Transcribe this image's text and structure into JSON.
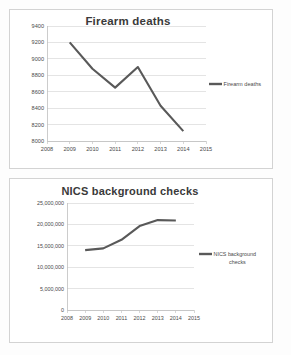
{
  "page": {
    "background_color": "#fdfdfd",
    "panel_border_color": "#d3d3d3"
  },
  "charts": [
    {
      "id": "firearm",
      "title": "Firearm deaths",
      "legend_label": "Firearm deaths",
      "legend_label_line1": "Firearm deaths",
      "legend_label_line2": "",
      "series_color": "#595959",
      "y_ticks": [
        "8000",
        "8200",
        "8400",
        "8600",
        "8800",
        "9000",
        "9200",
        "9400"
      ],
      "x_ticks": [
        "2008",
        "2009",
        "2010",
        "2011",
        "2012",
        "2013",
        "2014",
        "2015"
      ]
    },
    {
      "id": "nics",
      "title": "NICS background checks",
      "legend_label": "NICS background checks",
      "legend_label_line1": "NICS background",
      "legend_label_line2": "checks",
      "series_color": "#595959",
      "y_ticks": [
        "0",
        "5,000,000",
        "10,000,000",
        "15,000,000",
        "20,000,000",
        "25,000,000"
      ],
      "x_ticks": [
        "2008",
        "2009",
        "2010",
        "2011",
        "2012",
        "2013",
        "2014",
        "2015"
      ]
    }
  ],
  "chart_data": [
    {
      "type": "line",
      "id": "firearm",
      "title": "Firearm deaths",
      "xlabel": "",
      "ylabel": "",
      "x": [
        2009,
        2010,
        2011,
        2012,
        2013,
        2014
      ],
      "series": [
        {
          "name": "Firearm deaths",
          "values": [
            9200,
            8880,
            8650,
            8900,
            8430,
            8120
          ],
          "color": "#595959"
        }
      ],
      "xlim": [
        2008,
        2015
      ],
      "ylim": [
        8000,
        9400
      ],
      "y_tick_values": [
        8000,
        8200,
        8400,
        8600,
        8800,
        9000,
        9200,
        9400
      ],
      "x_tick_values": [
        2008,
        2009,
        2010,
        2011,
        2012,
        2013,
        2014,
        2015
      ],
      "grid": true,
      "legend": [
        "Firearm deaths"
      ],
      "legend_position": "right"
    },
    {
      "type": "line",
      "id": "nics",
      "title": "NICS background checks",
      "xlabel": "",
      "ylabel": "",
      "x": [
        2009,
        2010,
        2011,
        2012,
        2013,
        2014
      ],
      "series": [
        {
          "name": "NICS background checks",
          "values": [
            14000000,
            14400000,
            16400000,
            19600000,
            21000000,
            20900000
          ],
          "color": "#595959"
        }
      ],
      "xlim": [
        2008,
        2015
      ],
      "ylim": [
        0,
        25000000
      ],
      "y_tick_values": [
        0,
        5000000,
        10000000,
        15000000,
        20000000,
        25000000
      ],
      "x_tick_values": [
        2008,
        2009,
        2010,
        2011,
        2012,
        2013,
        2014,
        2015
      ],
      "grid": true,
      "legend": [
        "NICS background checks"
      ],
      "legend_position": "right"
    }
  ]
}
